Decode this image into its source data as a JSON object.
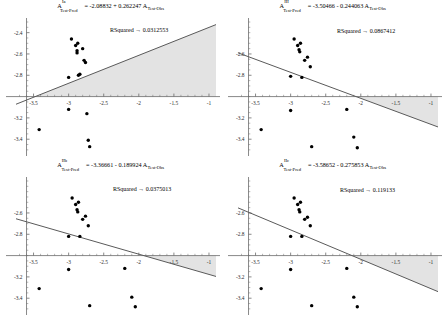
{
  "figure": {
    "background": "#ffffff",
    "axis_color": "#6b6b6b",
    "line_color": "#5a5a5a",
    "point_color": "#000000",
    "shade_color": "#e3e3e3",
    "panel_count": 4
  },
  "panels": [
    {
      "id": "panel-Ia",
      "label_super": "Ia",
      "lhs": "A",
      "lhs_sub": "Test-Pred",
      "equals": "=",
      "equation_rhs": "-2.08832 + 0.262247 A",
      "rhs_sub": "Test-Obs",
      "rsquared_label": "RSquared → 0.0312553",
      "chart_data": {
        "type": "scatter",
        "title": "A_Test-Pred^Ia = -2.08832 + 0.262247 A_Test-Obs",
        "xlabel": "",
        "ylabel": "",
        "xlim": [
          -3.75,
          -0.9
        ],
        "ylim": [
          -3.52,
          -2.3
        ],
        "xticks": [
          -3.5,
          -3,
          -2.5,
          -2,
          -1.5,
          -1
        ],
        "xticklabels": [
          "-3.5",
          "-3",
          "-2.5",
          "-2",
          "-1.5",
          "-1"
        ],
        "yticks": [
          -2.4,
          -2.6,
          -2.8,
          -3.2,
          -3.4
        ],
        "yticklabels": [
          "-2.4",
          "-2.6",
          "-2.8",
          "-3.2",
          "-3.4"
        ],
        "grid": false,
        "fit": {
          "intercept": -2.08832,
          "slope": 0.262247,
          "rsquared": 0.0312553
        },
        "shaded_between_fit_and_zero_axis": true,
        "x": [
          -3.42,
          -3.0,
          -3.0,
          -2.96,
          -2.9,
          -2.88,
          -2.88,
          -2.87,
          -2.86,
          -2.84,
          -2.8,
          -2.78,
          -2.76,
          -2.74,
          -2.72,
          -2.7
        ],
        "y": [
          -3.31,
          -2.82,
          -3.12,
          -2.46,
          -2.52,
          -2.57,
          -2.59,
          -2.5,
          -2.8,
          -2.79,
          -2.55,
          -2.66,
          -2.68,
          -3.16,
          -3.41,
          -3.47
        ]
      }
    },
    {
      "id": "panel-III",
      "label_super": "III",
      "lhs": "A",
      "lhs_sub": "Test-Pred",
      "equals": "=",
      "equation_rhs": "-3.50466 - 0.244063 A",
      "rhs_sub": "Test-Obs",
      "rsquared_label": "RSquared → 0.0867412",
      "chart_data": {
        "type": "scatter",
        "title": "A_Test-Pred^III = -3.50466 - 0.244063 A_Test-Obs",
        "xlabel": "",
        "ylabel": "",
        "xlim": [
          -3.75,
          -0.9
        ],
        "ylim": [
          -3.52,
          -2.3
        ],
        "xticks": [
          -3.5,
          -3,
          -2.5,
          -2,
          -1.5,
          -1
        ],
        "xticklabels": [
          "-3.5",
          "-3",
          "-2.5",
          "-2",
          "-1.5",
          "-1"
        ],
        "yticks": [
          -2.6,
          -2.8,
          -3.2,
          -3.4
        ],
        "yticklabels": [
          "-2.6",
          "-2.8",
          "-3.2",
          "-3.4"
        ],
        "grid": false,
        "fit": {
          "intercept": -3.50466,
          "slope": -0.244063,
          "rsquared": 0.0867412
        },
        "shaded_between_fit_and_zero_axis": true,
        "x": [
          -3.42,
          -3.0,
          -3.0,
          -2.95,
          -2.9,
          -2.88,
          -2.87,
          -2.86,
          -2.84,
          -2.8,
          -2.76,
          -2.72,
          -2.7,
          -2.2,
          -2.1,
          -2.05
        ],
        "y": [
          -3.31,
          -2.81,
          -3.13,
          -2.46,
          -2.52,
          -2.56,
          -2.58,
          -2.5,
          -2.82,
          -2.66,
          -2.63,
          -2.72,
          -3.47,
          -3.12,
          -3.38,
          -3.48
        ]
      }
    },
    {
      "id": "panel-IIb",
      "label_super": "IIb",
      "lhs": "A",
      "lhs_sub": "Test-Pred",
      "equals": "=",
      "equation_rhs": "-3.36661 - 0.189924 A",
      "rhs_sub": "Test-Obs",
      "rsquared_label": "RSquared → 0.0375013",
      "chart_data": {
        "type": "scatter",
        "title": "A_Test-Pred^IIb = -3.36661 - 0.189924 A_Test-Obs",
        "xlabel": "",
        "ylabel": "",
        "xlim": [
          -3.75,
          -0.9
        ],
        "ylim": [
          -3.52,
          -2.3
        ],
        "xticks": [
          -3.5,
          -3,
          -2.5,
          -2,
          -1.5,
          -1
        ],
        "xticklabels": [
          "-3.5",
          "-3",
          "-2.5",
          "-2",
          "-1.5",
          "-1"
        ],
        "yticks": [
          -2.6,
          -2.8,
          -3.2,
          -3.4
        ],
        "yticklabels": [
          "-2.6",
          "-2.8",
          "-3.2",
          "-3.4"
        ],
        "grid": false,
        "fit": {
          "intercept": -3.36661,
          "slope": -0.189924,
          "rsquared": 0.0375013
        },
        "shaded_between_fit_and_zero_axis": true,
        "x": [
          -3.42,
          -3.0,
          -3.0,
          -2.95,
          -2.9,
          -2.88,
          -2.87,
          -2.86,
          -2.84,
          -2.8,
          -2.76,
          -2.72,
          -2.7,
          -2.2,
          -2.1,
          -2.05
        ],
        "y": [
          -3.31,
          -2.82,
          -3.13,
          -2.46,
          -2.52,
          -2.57,
          -2.59,
          -2.5,
          -2.82,
          -2.66,
          -2.63,
          -2.72,
          -3.47,
          -3.12,
          -3.39,
          -3.48
        ]
      }
    },
    {
      "id": "panel-IIc",
      "label_super": "IIc",
      "lhs": "A",
      "lhs_sub": "Test-Pred",
      "equals": "=",
      "equation_rhs": "-3.58652 - 0.275853 A",
      "rhs_sub": "Test-Obs",
      "rsquared_label": "RSquared → 0.119133",
      "chart_data": {
        "type": "scatter",
        "title": "A_Test-Pred^IIc = -3.58652 - 0.275853 A_Test-Obs",
        "xlabel": "",
        "ylabel": "",
        "xlim": [
          -3.75,
          -0.9
        ],
        "ylim": [
          -3.52,
          -2.3
        ],
        "xticks": [
          -3.5,
          -3,
          -2.5,
          -2,
          -1.5,
          -1
        ],
        "xticklabels": [
          "-3.5",
          "-3",
          "-2.5",
          "-2",
          "-1.5",
          "-1"
        ],
        "yticks": [
          -2.6,
          -2.8,
          -3.2,
          -3.4
        ],
        "yticklabels": [
          "-2.6",
          "-2.8",
          "-3.2",
          "-3.4"
        ],
        "grid": false,
        "fit": {
          "intercept": -3.58652,
          "slope": -0.275853,
          "rsquared": 0.119133
        },
        "shaded_between_fit_and_zero_axis": true,
        "x": [
          -3.42,
          -3.0,
          -3.0,
          -2.95,
          -2.9,
          -2.88,
          -2.87,
          -2.86,
          -2.84,
          -2.8,
          -2.76,
          -2.72,
          -2.7,
          -2.2,
          -2.1,
          -2.05
        ],
        "y": [
          -3.31,
          -2.82,
          -3.13,
          -2.46,
          -2.52,
          -2.57,
          -2.59,
          -2.5,
          -2.82,
          -2.66,
          -2.64,
          -2.72,
          -3.47,
          -3.12,
          -3.39,
          -3.48
        ]
      }
    }
  ]
}
